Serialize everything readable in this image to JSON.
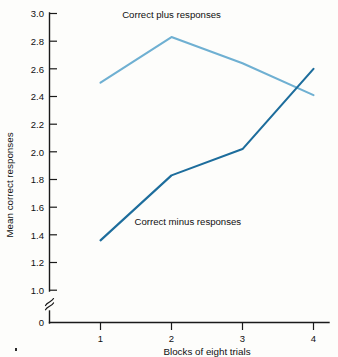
{
  "chart_data": {
    "type": "line",
    "title": "",
    "xlabel": "Blocks of eight trials",
    "ylabel": "Mean correct responses",
    "x": [
      1,
      2,
      3,
      4
    ],
    "xticklabels": [
      "1",
      "2",
      "3",
      "4"
    ],
    "yticklabels": [
      "0",
      "1.0",
      "1.2",
      "1.4",
      "1.6",
      "1.8",
      "2.0",
      "2.2",
      "2.4",
      "2.6",
      "2.8",
      "3.0"
    ],
    "ytickvalues": [
      0,
      1.0,
      1.2,
      1.4,
      1.6,
      1.8,
      2.0,
      2.2,
      2.4,
      2.6,
      2.8,
      3.0
    ],
    "ylim": [
      1.0,
      3.0
    ],
    "xlim": [
      1,
      4
    ],
    "axis_break": true,
    "axis_break_symbol": "≈",
    "grid": false,
    "legend": "inline-annotation",
    "series": [
      {
        "name": "Correct plus responses",
        "values": [
          2.5,
          2.83,
          2.64,
          2.41
        ],
        "color": "#6FB0D2",
        "annotation": "Correct plus responses",
        "annotation_x": 2.0,
        "annotation_y": 2.97
      },
      {
        "name": "Correct minus responses",
        "values": [
          1.36,
          1.83,
          2.02,
          2.6
        ],
        "color": "#1D6D9C",
        "annotation": "Correct minus responses",
        "annotation_x": 2.23,
        "annotation_y": 1.47
      }
    ]
  },
  "colors": {
    "plus_line": "#6FB0D2",
    "minus_line": "#1D6D9C",
    "axis": "#1a1a1a",
    "text": "#101010",
    "background": "#fdfdfb"
  }
}
